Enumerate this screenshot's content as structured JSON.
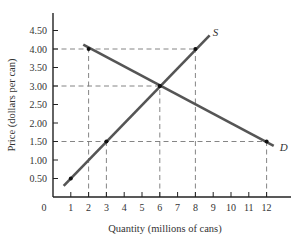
{
  "chart_data": {
    "type": "line",
    "title": "",
    "xlabel": "Quantity (millions of cans)",
    "ylabel": "Price (dollars per can)",
    "xlim": [
      0,
      13
    ],
    "ylim": [
      0,
      4.75
    ],
    "x_ticks": [
      1,
      2,
      3,
      4,
      5,
      6,
      7,
      8,
      9,
      10,
      11,
      12
    ],
    "x_tick_labels": [
      "1",
      "2",
      "3",
      "4",
      "5",
      "6",
      "7",
      "8",
      "9",
      "10",
      "11",
      "12"
    ],
    "y_ticks": [
      0.5,
      1.0,
      1.5,
      2.0,
      2.5,
      3.0,
      3.5,
      4.0,
      4.5
    ],
    "y_tick_labels": [
      "0.50",
      "1.00",
      "1.50",
      "2.00",
      "2.50",
      "3.00",
      "3.50",
      "4.00",
      "4.50"
    ],
    "origin_label": "0",
    "grid": false,
    "series": [
      {
        "name": "S",
        "label": "S",
        "description": "Supply",
        "line": [
          [
            0.6,
            0.3
          ],
          [
            8.8,
            4.37
          ]
        ],
        "points": [
          [
            1,
            0.5
          ],
          [
            3,
            1.5
          ],
          [
            6,
            3.0
          ],
          [
            8,
            4.0
          ]
        ]
      },
      {
        "name": "D",
        "label": "D",
        "description": "Demand",
        "line": [
          [
            1.7,
            4.12
          ],
          [
            12.4,
            1.38
          ]
        ],
        "points": [
          [
            2,
            4.0
          ],
          [
            6,
            3.0
          ],
          [
            12,
            1.5
          ]
        ]
      }
    ],
    "reference_lines": [
      {
        "type": "horizontal",
        "y": 4.0,
        "x_from": 0,
        "x_to": 8
      },
      {
        "type": "horizontal",
        "y": 3.0,
        "x_from": 0,
        "x_to": 6
      },
      {
        "type": "horizontal",
        "y": 1.5,
        "x_from": 0,
        "x_to": 12
      },
      {
        "type": "vertical",
        "x": 2,
        "y_from": 0,
        "y_to": 4.0
      },
      {
        "type": "vertical",
        "x": 3,
        "y_from": 0,
        "y_to": 1.5
      },
      {
        "type": "vertical",
        "x": 6,
        "y_from": 0,
        "y_to": 3.0
      },
      {
        "type": "vertical",
        "x": 8,
        "y_from": 0,
        "y_to": 4.0
      },
      {
        "type": "vertical",
        "x": 12,
        "y_from": 0,
        "y_to": 1.5
      }
    ],
    "equilibrium": {
      "quantity": 6,
      "price": 3.0
    }
  },
  "colors": {
    "curve": "#555555",
    "axis": "#222222",
    "dash": "#777777",
    "point": "#111111"
  }
}
